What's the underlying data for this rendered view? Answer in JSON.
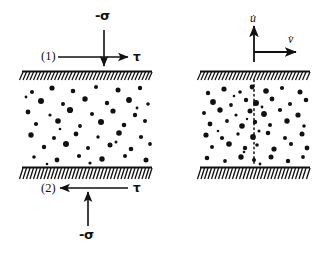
{
  "figure": {
    "type": "shear-cell-diagram",
    "background_color": "#ffffff",
    "ink_color": "#111111"
  },
  "left_panel": {
    "name": "stress-loading-panel",
    "top_plate": {
      "label": "(1)",
      "x": 22,
      "y": 71,
      "width": 130
    },
    "bottom_plate": {
      "label": "(2)",
      "x": 22,
      "y": 168,
      "width": 130
    },
    "top_normal_stress": {
      "label": "-σ",
      "arrow_direction": "down",
      "x": 104,
      "y_start": 30,
      "y_end": 66
    },
    "top_shear_stress": {
      "label": "τ",
      "arrow_direction": "right",
      "y": 57,
      "x_start": 58,
      "x_end": 128
    },
    "bottom_shear_stress": {
      "label": "τ",
      "arrow_direction": "left",
      "y": 188,
      "x_start": 128,
      "x_end": 58
    },
    "bottom_normal_stress": {
      "label": "-σ",
      "arrow_direction": "up",
      "x": 88,
      "y_start": 226,
      "y_end": 192
    }
  },
  "right_panel": {
    "name": "velocity-frame-panel",
    "top_plate": {
      "x": 200,
      "y": 71,
      "width": 110
    },
    "bottom_plate": {
      "x": 200,
      "y": 168,
      "width": 110
    },
    "vertical_axis": {
      "label": "u̇",
      "arrow_direction": "up",
      "x": 254,
      "y_start": 62,
      "y_end": 26
    },
    "horizontal_axis": {
      "label": "v̇",
      "arrow_direction": "right",
      "y": 52,
      "x_start": 254,
      "x_end": 296
    },
    "shear_band": {
      "name": "dotted-shear-line",
      "style": "dotted",
      "x": 254,
      "y_start": 80,
      "y_end": 166
    }
  },
  "granular_medium": {
    "name": "particle-field",
    "left_particles": [
      [
        32,
        92,
        2.0
      ],
      [
        52,
        88,
        2.6
      ],
      [
        73,
        91,
        2.3
      ],
      [
        96,
        87,
        2.0
      ],
      [
        118,
        90,
        2.5
      ],
      [
        140,
        88,
        2.2
      ],
      [
        41,
        101,
        3.0
      ],
      [
        63,
        104,
        2.0
      ],
      [
        85,
        99,
        2.7
      ],
      [
        107,
        103,
        2.2
      ],
      [
        129,
        100,
        2.9
      ],
      [
        148,
        104,
        1.8
      ],
      [
        28,
        112,
        2.4
      ],
      [
        50,
        115,
        1.6
      ],
      [
        70,
        110,
        3.1
      ],
      [
        92,
        114,
        2.0
      ],
      [
        113,
        111,
        2.6
      ],
      [
        135,
        115,
        2.2
      ],
      [
        36,
        124,
        2.1
      ],
      [
        58,
        121,
        2.8
      ],
      [
        80,
        126,
        1.9
      ],
      [
        101,
        122,
        3.0
      ],
      [
        124,
        125,
        2.3
      ],
      [
        145,
        121,
        2.0
      ],
      [
        31,
        135,
        2.7
      ],
      [
        54,
        138,
        2.0
      ],
      [
        76,
        134,
        2.4
      ],
      [
        98,
        137,
        1.7
      ],
      [
        119,
        133,
        2.8
      ],
      [
        141,
        137,
        2.1
      ],
      [
        44,
        147,
        2.2
      ],
      [
        66,
        144,
        3.0
      ],
      [
        88,
        148,
        2.0
      ],
      [
        110,
        145,
        2.5
      ],
      [
        131,
        149,
        2.3
      ],
      [
        150,
        144,
        1.9
      ],
      [
        34,
        157,
        1.8
      ],
      [
        57,
        160,
        2.4
      ],
      [
        79,
        156,
        2.1
      ],
      [
        102,
        159,
        2.7
      ],
      [
        125,
        156,
        2.0
      ],
      [
        146,
        160,
        2.5
      ],
      [
        26,
        97,
        1.4
      ],
      [
        60,
        129,
        1.3
      ],
      [
        116,
        142,
        1.5
      ],
      [
        90,
        163,
        1.6
      ],
      [
        137,
        108,
        1.4
      ],
      [
        47,
        164,
        1.3
      ]
    ],
    "right_particles": [
      [
        208,
        93,
        2.2
      ],
      [
        224,
        89,
        2.6
      ],
      [
        240,
        92,
        1.8
      ],
      [
        252,
        87,
        2.4
      ],
      [
        266,
        91,
        2.8
      ],
      [
        282,
        88,
        2.1
      ],
      [
        300,
        92,
        2.5
      ],
      [
        213,
        102,
        2.9
      ],
      [
        231,
        105,
        1.9
      ],
      [
        246,
        100,
        2.2
      ],
      [
        256,
        103,
        3.0
      ],
      [
        272,
        99,
        2.4
      ],
      [
        290,
        104,
        2.0
      ],
      [
        306,
        100,
        2.3
      ],
      [
        204,
        113,
        2.0
      ],
      [
        220,
        110,
        2.7
      ],
      [
        236,
        115,
        1.6
      ],
      [
        250,
        111,
        2.5
      ],
      [
        264,
        114,
        2.9
      ],
      [
        280,
        110,
        2.1
      ],
      [
        298,
        115,
        2.6
      ],
      [
        210,
        124,
        2.4
      ],
      [
        227,
        121,
        1.9
      ],
      [
        242,
        126,
        2.8
      ],
      [
        255,
        122,
        2.2
      ],
      [
        270,
        125,
        2.0
      ],
      [
        287,
        121,
        2.7
      ],
      [
        304,
        126,
        1.8
      ],
      [
        206,
        135,
        2.6
      ],
      [
        222,
        138,
        2.1
      ],
      [
        238,
        134,
        1.7
      ],
      [
        253,
        137,
        2.9
      ],
      [
        268,
        133,
        2.3
      ],
      [
        285,
        138,
        2.0
      ],
      [
        302,
        134,
        2.5
      ],
      [
        212,
        147,
        2.0
      ],
      [
        229,
        144,
        2.8
      ],
      [
        245,
        148,
        2.2
      ],
      [
        257,
        145,
        1.8
      ],
      [
        274,
        149,
        2.6
      ],
      [
        291,
        144,
        2.1
      ],
      [
        307,
        148,
        2.4
      ],
      [
        207,
        158,
        2.3
      ],
      [
        225,
        161,
        1.9
      ],
      [
        241,
        157,
        2.7
      ],
      [
        254,
        160,
        2.0
      ],
      [
        271,
        157,
        2.5
      ],
      [
        288,
        161,
        2.2
      ],
      [
        303,
        157,
        1.9
      ],
      [
        234,
        96,
        1.3
      ],
      [
        262,
        107,
        1.4
      ],
      [
        247,
        119,
        1.2
      ],
      [
        259,
        131,
        1.5
      ],
      [
        244,
        152,
        1.3
      ],
      [
        260,
        164,
        1.4
      ],
      [
        218,
        131,
        1.3
      ]
    ]
  }
}
